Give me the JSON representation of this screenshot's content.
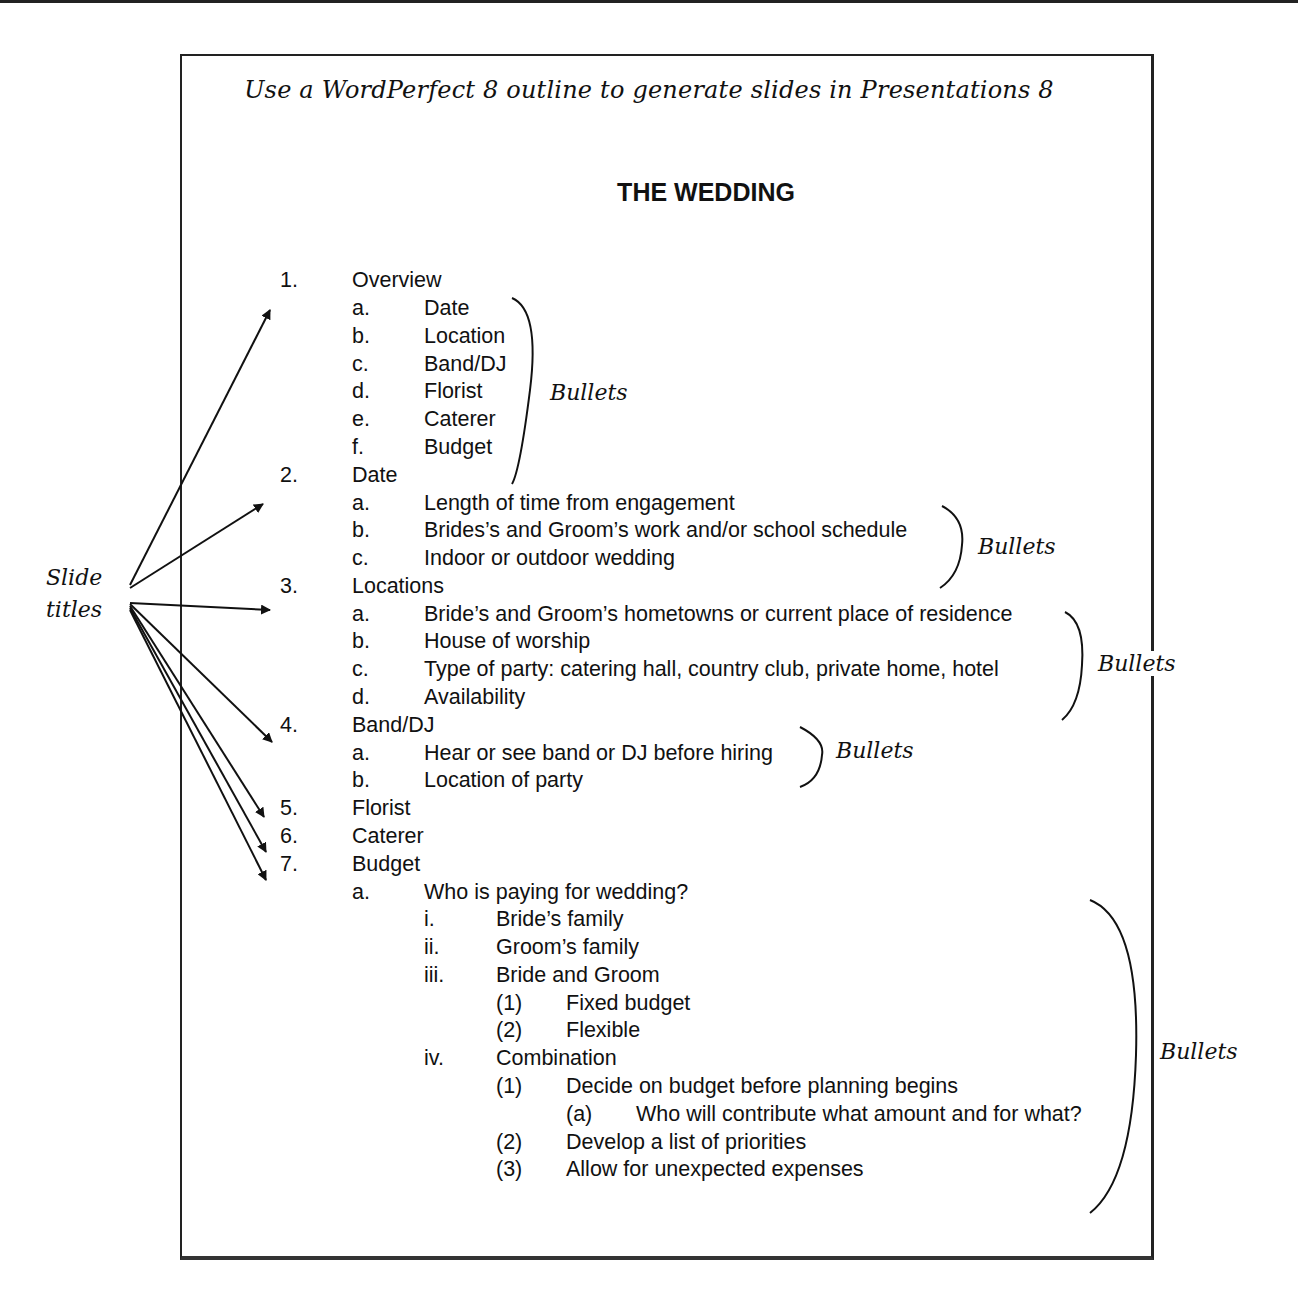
{
  "caption": "Use a WordPerfect 8 outline to generate slides in Presentations 8",
  "title": "THE WEDDING",
  "outline": [
    {
      "num": "1.",
      "text": "Overview",
      "level": 0,
      "y": 266
    },
    {
      "num": "a.",
      "text": "Date",
      "level": 1,
      "y": 294
    },
    {
      "num": "b.",
      "text": "Location",
      "level": 1,
      "y": 322
    },
    {
      "num": "c.",
      "text": "Band/DJ",
      "level": 1,
      "y": 350
    },
    {
      "num": "d.",
      "text": "Florist",
      "level": 1,
      "y": 377
    },
    {
      "num": "e.",
      "text": "Caterer",
      "level": 1,
      "y": 405
    },
    {
      "num": "f.",
      "text": "Budget",
      "level": 1,
      "y": 433
    },
    {
      "num": "2.",
      "text": "Date",
      "level": 0,
      "y": 461
    },
    {
      "num": "a.",
      "text": "Length of time from engagement",
      "level": 1,
      "y": 489
    },
    {
      "num": "b.",
      "text": "Brides’s and Groom’s work and/or school schedule",
      "level": 1,
      "y": 516
    },
    {
      "num": "c.",
      "text": "Indoor or outdoor wedding",
      "level": 1,
      "y": 544
    },
    {
      "num": "3.",
      "text": "Locations",
      "level": 0,
      "y": 572
    },
    {
      "num": "a.",
      "text": "Bride’s and Groom’s hometowns or current place of residence",
      "level": 1,
      "y": 600
    },
    {
      "num": "b.",
      "text": "House of worship",
      "level": 1,
      "y": 627
    },
    {
      "num": "c.",
      "text": "Type of party: catering hall, country club, private home, hotel",
      "level": 1,
      "y": 655
    },
    {
      "num": "d.",
      "text": "Availability",
      "level": 1,
      "y": 683
    },
    {
      "num": "4.",
      "text": "Band/DJ",
      "level": 0,
      "y": 711
    },
    {
      "num": "a.",
      "text": "Hear or see band or DJ before hiring",
      "level": 1,
      "y": 739
    },
    {
      "num": "b.",
      "text": "Location of party",
      "level": 1,
      "y": 766
    },
    {
      "num": "5.",
      "text": "Florist",
      "level": 0,
      "y": 794
    },
    {
      "num": "6.",
      "text": "Caterer",
      "level": 0,
      "y": 822
    },
    {
      "num": "7.",
      "text": "Budget",
      "level": 0,
      "y": 850
    },
    {
      "num": "a.",
      "text": "Who is paying for wedding?",
      "level": 1,
      "y": 878
    },
    {
      "num": "i.",
      "text": "Bride’s family",
      "level": 2,
      "y": 905
    },
    {
      "num": "ii.",
      "text": "Groom’s family",
      "level": 2,
      "y": 933
    },
    {
      "num": "iii.",
      "text": "Bride and Groom",
      "level": 2,
      "y": 961
    },
    {
      "num": "(1)",
      "text": "Fixed budget",
      "level": 3,
      "y": 989
    },
    {
      "num": "(2)",
      "text": "Flexible",
      "level": 3,
      "y": 1016
    },
    {
      "num": "iv.",
      "text": "Combination",
      "level": 2,
      "y": 1044
    },
    {
      "num": "(1)",
      "text": "Decide on budget before planning begins",
      "level": 3,
      "y": 1072
    },
    {
      "num": "(a)",
      "text": "Who will contribute what amount and for what?",
      "level": 4,
      "y": 1100
    },
    {
      "num": "(2)",
      "text": "Develop a list of priorities",
      "level": 3,
      "y": 1128
    },
    {
      "num": "(3)",
      "text": "Allow for unexpected expenses",
      "level": 3,
      "y": 1155
    }
  ],
  "annotations": {
    "slide_titles_line1": "Slide",
    "slide_titles_line2": "titles",
    "bullets": [
      "Bullets",
      "Bullets",
      "Bullets",
      "Bullets",
      "Bullets"
    ]
  }
}
